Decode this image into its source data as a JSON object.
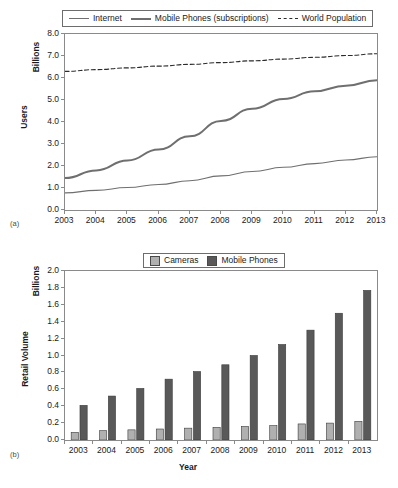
{
  "figure_a": {
    "caption": "(a)",
    "y_axis_title": "Users",
    "y_unit_label": "Billions",
    "y_ticks": [
      "8.0",
      "7.0",
      "6.0",
      "5.0",
      "4.0",
      "3.0",
      "2.0",
      "1.0",
      "0.0"
    ],
    "x_ticks": [
      "2003",
      "2004",
      "2005",
      "2006",
      "2007",
      "2008",
      "2009",
      "2010",
      "2011",
      "2012",
      "2013"
    ],
    "legend": [
      {
        "label": "Internet",
        "style": "thin-solid",
        "color": "#6f6f6f"
      },
      {
        "label": "Mobile Phones (subscriptions)",
        "style": "thick-solid",
        "color": "#6f6f6f"
      },
      {
        "label": "World Population",
        "style": "dashed",
        "color": "#2b2b2b"
      }
    ]
  },
  "figure_b": {
    "caption": "(b)",
    "y_axis_title": "Retail Volume",
    "y_unit_label": "Billions",
    "x_axis_title": "Year",
    "y_ticks": [
      "2.0",
      "1.8",
      "1.6",
      "1.4",
      "1.2",
      "1.0",
      "0.8",
      "0.6",
      "0.4",
      "0.2",
      "0.0"
    ],
    "x_ticks": [
      "2003",
      "2004",
      "2005",
      "2006",
      "2007",
      "2008",
      "2009",
      "2010",
      "2011",
      "2012",
      "2013"
    ],
    "legend": [
      {
        "label": "Cameras",
        "color": "#b0b0b0"
      },
      {
        "label": "Mobile Phones",
        "color": "#595959"
      }
    ]
  },
  "chart_data": [
    {
      "type": "line",
      "title": "",
      "xlabel": "",
      "ylabel": "Users",
      "y_unit": "Billions",
      "grid": false,
      "legend_position": "top",
      "xlim": [
        2003,
        2013
      ],
      "ylim": [
        0.0,
        8.0
      ],
      "x": [
        2003,
        2004,
        2005,
        2006,
        2007,
        2008,
        2009,
        2010,
        2011,
        2012,
        2013
      ],
      "series": [
        {
          "name": "Internet",
          "color": "#6f6f6f",
          "style": "thin-solid",
          "values": [
            0.78,
            0.89,
            1.02,
            1.16,
            1.33,
            1.55,
            1.75,
            1.94,
            2.11,
            2.27,
            2.42
          ]
        },
        {
          "name": "Mobile Phones (subscriptions)",
          "color": "#6f6f6f",
          "style": "thick-solid",
          "values": [
            1.45,
            1.8,
            2.25,
            2.75,
            3.35,
            4.05,
            4.6,
            5.05,
            5.4,
            5.65,
            5.9
          ]
        },
        {
          "name": "World Population",
          "color": "#2b2b2b",
          "style": "dashed",
          "values": [
            6.3,
            6.38,
            6.46,
            6.54,
            6.62,
            6.7,
            6.78,
            6.86,
            6.94,
            7.02,
            7.1
          ]
        }
      ]
    },
    {
      "type": "bar",
      "title": "",
      "xlabel": "Year",
      "ylabel": "Retail Volume",
      "y_unit": "Billions",
      "grid": false,
      "legend_position": "top",
      "ylim": [
        0.0,
        2.0
      ],
      "categories": [
        "2003",
        "2004",
        "2005",
        "2006",
        "2007",
        "2008",
        "2009",
        "2010",
        "2011",
        "2012",
        "2013"
      ],
      "series": [
        {
          "name": "Cameras",
          "color": "#b0b0b0",
          "values": [
            0.09,
            0.11,
            0.12,
            0.13,
            0.14,
            0.15,
            0.16,
            0.17,
            0.19,
            0.2,
            0.22
          ]
        },
        {
          "name": "Mobile Phones",
          "color": "#595959",
          "values": [
            0.41,
            0.52,
            0.61,
            0.72,
            0.81,
            0.89,
            1.0,
            1.13,
            1.3,
            1.5,
            1.77
          ]
        }
      ]
    }
  ]
}
